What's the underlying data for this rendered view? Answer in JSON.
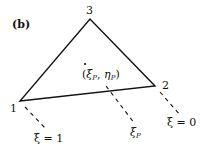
{
  "panel_label": "(b)",
  "vertices": [
    {
      "id": "1",
      "label": "1",
      "x": 20,
      "y": 101
    },
    {
      "id": "2",
      "label": "2",
      "x": 155,
      "y": 86
    },
    {
      "id": "3",
      "label": "3",
      "x": 90,
      "y": 19
    }
  ],
  "point": {
    "label": "(ξP, ηP)",
    "xi": "ξ",
    "xi_sub": "P",
    "eta": "η",
    "eta_sub": "P",
    "x": 85,
    "y": 64
  },
  "dashed_lines": [
    {
      "label": "ξ = 1",
      "x1": 25,
      "y1": 107,
      "x2": 46,
      "y2": 129
    },
    {
      "label": "ξP",
      "x1": 106,
      "y1": 86,
      "x2": 135,
      "y2": 124
    },
    {
      "label": "ξ = 0",
      "x1": 160,
      "y1": 92,
      "x2": 181,
      "y2": 116
    }
  ],
  "labels": {
    "xi_eq_1": "ξ = 1",
    "xi_eq_0": "ξ = 0",
    "xi_p_main": "ξ",
    "xi_p_sub": "P"
  },
  "colors": {
    "stroke": "#111111",
    "background": "#ffffff"
  }
}
